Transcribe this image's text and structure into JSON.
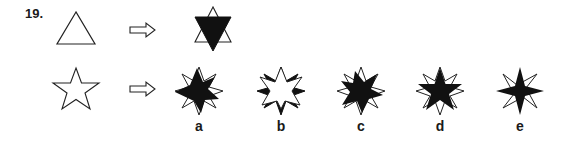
{
  "question": {
    "number": "19.",
    "example": {
      "source_shape": "outline-triangle",
      "arrow": "double-arrow-right",
      "result_shape": "star-of-david-white-up-black-down-triangle"
    },
    "problem": {
      "source_shape": "outline-five-point-star",
      "arrow": "double-arrow-right"
    },
    "options": [
      {
        "label": "a",
        "shape": "eight-point-star-black-left-offset"
      },
      {
        "label": "b",
        "shape": "eight-point-star-white-front-black-tips"
      },
      {
        "label": "c",
        "shape": "eight-point-star-black-seven-point-front"
      },
      {
        "label": "d",
        "shape": "eight-point-star-black-five-point-front"
      },
      {
        "label": "e",
        "shape": "eight-point-star-black-four-point-front"
      }
    ]
  },
  "colors": {
    "stroke": "#222222",
    "fill_black": "#111111",
    "fill_white": "#ffffff",
    "background": "#ffffff"
  }
}
